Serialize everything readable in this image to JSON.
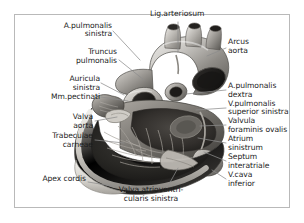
{
  "figure": {
    "style": "grayscale anatomical photograph with leader-line labels",
    "language": "Latin anatomical nomenclature",
    "frame_color": "#b9b9b9",
    "background_color": "#ffffff",
    "text_color": "#1c1c1c",
    "leader_line_color": "#8c8c8c"
  },
  "labels": [
    {
      "id": "lig-arteriosum",
      "text": "Lig.arteriosum",
      "align": "left",
      "x": 150,
      "y": 14
    },
    {
      "id": "a-pulmonalis-sin-1",
      "text": "A.pulmonalis",
      "align": "right",
      "x": 63,
      "y": 26,
      "right_x": 112
    },
    {
      "id": "a-pulmonalis-sin-2",
      "text": "sinistra",
      "align": "right",
      "x": 63,
      "y": 34,
      "right_x": 112
    },
    {
      "id": "arcus-aorta-1",
      "text": "Arcus",
      "align": "left",
      "x": 228,
      "y": 42
    },
    {
      "id": "arcus-aorta-2",
      "text": "aorta",
      "align": "left",
      "x": 228,
      "y": 51
    },
    {
      "id": "truncus-pulm-1",
      "text": "Truncus",
      "align": "right",
      "x": 63,
      "y": 52,
      "right_x": 117
    },
    {
      "id": "truncus-pulm-2",
      "text": "pulmonalis",
      "align": "right",
      "x": 63,
      "y": 61,
      "right_x": 117
    },
    {
      "id": "auricula-sin-1",
      "text": "Auricula",
      "align": "right",
      "x": 45,
      "y": 79,
      "right_x": 100
    },
    {
      "id": "auricula-sin-2",
      "text": "sinistra",
      "align": "right",
      "x": 45,
      "y": 88,
      "right_x": 100
    },
    {
      "id": "mm-pectinati",
      "text": "Mm.pectinati",
      "align": "right",
      "x": 22,
      "y": 97,
      "right_x": 100
    },
    {
      "id": "a-pulmonalis-dex-1",
      "text": "A.pulmonalis",
      "align": "left",
      "x": 228,
      "y": 86
    },
    {
      "id": "a-pulmonalis-dex-2",
      "text": "dextra",
      "align": "left",
      "x": 228,
      "y": 95
    },
    {
      "id": "v-pulmonalis-1",
      "text": "V.pulmonalis",
      "align": "left",
      "x": 228,
      "y": 104
    },
    {
      "id": "v-pulmonalis-2",
      "text": "superior sinistra",
      "align": "left",
      "x": 228,
      "y": 112
    },
    {
      "id": "valvula-for-ov-1",
      "text": "Valvula",
      "align": "left",
      "x": 228,
      "y": 121
    },
    {
      "id": "valvula-for-ov-2",
      "text": "foraminis ovalis",
      "align": "left",
      "x": 228,
      "y": 130
    },
    {
      "id": "atrium-sin-1",
      "text": "Atrium",
      "align": "left",
      "x": 228,
      "y": 139
    },
    {
      "id": "atrium-sin-2",
      "text": "sinistrum",
      "align": "left",
      "x": 228,
      "y": 148
    },
    {
      "id": "septum-inter-1",
      "text": "Septum",
      "align": "left",
      "x": 228,
      "y": 157
    },
    {
      "id": "septum-inter-2",
      "text": "interatriale",
      "align": "left",
      "x": 228,
      "y": 166
    },
    {
      "id": "v-cava-inf-1",
      "text": "V.cava",
      "align": "left",
      "x": 228,
      "y": 175
    },
    {
      "id": "v-cava-inf-2",
      "text": "inferior",
      "align": "left",
      "x": 228,
      "y": 184
    },
    {
      "id": "valva-aorta-1",
      "text": "Valva",
      "align": "right",
      "x": 45,
      "y": 117,
      "right_x": 93
    },
    {
      "id": "valva-aorta-2",
      "text": "aorta",
      "align": "right",
      "x": 45,
      "y": 126,
      "right_x": 93
    },
    {
      "id": "trabeculae-1",
      "text": "Trabeculae",
      "align": "right",
      "x": 20,
      "y": 136,
      "right_x": 93
    },
    {
      "id": "trabeculae-2",
      "text": "carneae",
      "align": "right",
      "x": 20,
      "y": 145,
      "right_x": 93
    },
    {
      "id": "apex-cordis",
      "text": "Apex cordis",
      "align": "right",
      "x": 25,
      "y": 179,
      "right_x": 86
    },
    {
      "id": "valva-av-sin-1",
      "text": "Valva atrioventri-",
      "align": "center",
      "x": 133,
      "y": 190
    },
    {
      "id": "valva-av-sin-2",
      "text": "cularis sinistra",
      "align": "center",
      "x": 138,
      "y": 199
    }
  ],
  "anatomy_parts": [
    "Arcus aorta",
    "Lig.arteriosum",
    "A.pulmonalis sinistra",
    "A.pulmonalis dextra",
    "Truncus pulmonalis",
    "V.pulmonalis superior sinistra",
    "Auricula sinistra",
    "Mm.pectinati",
    "Valvula foraminis ovalis",
    "Atrium sinistrum",
    "Septum interatriale",
    "V.cava inferior",
    "Valva aorta",
    "Trabeculae carneae",
    "Apex cordis",
    "Valva atrioventricularis sinistra"
  ]
}
